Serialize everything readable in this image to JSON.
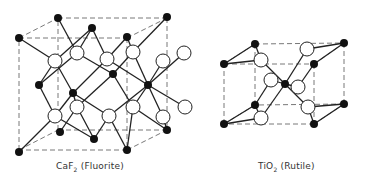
{
  "figures": [
    {
      "id": "fluorite",
      "formula": "CaF",
      "subscript": "2",
      "name": "(Fluorite)",
      "colors": {
        "cation": "#111111",
        "anion": "#ffffff",
        "bond": "#222222",
        "cell": "#555555"
      },
      "cell": {
        "front": [
          [
            19,
            38
          ],
          [
            127,
            38
          ],
          [
            127,
            150
          ],
          [
            19,
            150
          ]
        ],
        "back": [
          [
            58,
            18
          ],
          [
            167,
            18
          ],
          [
            167,
            130
          ],
          [
            58,
            130
          ]
        ]
      },
      "black_atoms": [
        [
          19,
          38
        ],
        [
          58,
          18
        ],
        [
          92,
          28
        ],
        [
          127,
          37
        ],
        [
          167,
          17
        ],
        [
          39,
          85
        ],
        [
          73,
          93
        ],
        [
          113,
          74
        ],
        [
          148,
          85
        ],
        [
          60,
          132
        ],
        [
          94,
          139
        ],
        [
          167,
          130
        ],
        [
          19,
          152
        ],
        [
          127,
          150
        ]
      ],
      "white_atoms": [
        [
          55,
          61
        ],
        [
          77,
          53
        ],
        [
          107,
          59
        ],
        [
          133,
          52
        ],
        [
          163,
          61
        ],
        [
          184,
          53
        ],
        [
          55,
          116
        ],
        [
          77,
          107
        ],
        [
          109,
          116
        ],
        [
          133,
          107
        ],
        [
          163,
          117
        ],
        [
          185,
          107
        ]
      ],
      "bonds": [
        [
          [
            19,
            38
          ],
          [
            55,
            61
          ]
        ],
        [
          [
            92,
            28
          ],
          [
            55,
            61
          ]
        ],
        [
          [
            39,
            85
          ],
          [
            55,
            61
          ]
        ],
        [
          [
            73,
            93
          ],
          [
            55,
            61
          ]
        ],
        [
          [
            92,
            28
          ],
          [
            77,
            53
          ]
        ],
        [
          [
            58,
            18
          ],
          [
            77,
            53
          ]
        ],
        [
          [
            113,
            74
          ],
          [
            77,
            53
          ]
        ],
        [
          [
            39,
            85
          ],
          [
            77,
            53
          ]
        ],
        [
          [
            92,
            28
          ],
          [
            107,
            59
          ]
        ],
        [
          [
            127,
            37
          ],
          [
            107,
            59
          ]
        ],
        [
          [
            73,
            93
          ],
          [
            107,
            59
          ]
        ],
        [
          [
            148,
            85
          ],
          [
            107,
            59
          ]
        ],
        [
          [
            127,
            37
          ],
          [
            133,
            52
          ]
        ],
        [
          [
            167,
            17
          ],
          [
            133,
            52
          ]
        ],
        [
          [
            113,
            74
          ],
          [
            133,
            52
          ]
        ],
        [
          [
            148,
            85
          ],
          [
            133,
            52
          ]
        ],
        [
          [
            148,
            85
          ],
          [
            163,
            61
          ]
        ],
        [
          [
            148,
            85
          ],
          [
            184,
            53
          ]
        ],
        [
          [
            148,
            85
          ],
          [
            163,
            117
          ]
        ],
        [
          [
            148,
            85
          ],
          [
            185,
            107
          ]
        ],
        [
          [
            39,
            85
          ],
          [
            55,
            116
          ]
        ],
        [
          [
            73,
            93
          ],
          [
            55,
            116
          ]
        ],
        [
          [
            19,
            152
          ],
          [
            55,
            116
          ]
        ],
        [
          [
            94,
            139
          ],
          [
            55,
            116
          ]
        ],
        [
          [
            73,
            93
          ],
          [
            77,
            107
          ]
        ],
        [
          [
            113,
            74
          ],
          [
            77,
            107
          ]
        ],
        [
          [
            60,
            132
          ],
          [
            77,
            107
          ]
        ],
        [
          [
            94,
            139
          ],
          [
            77,
            107
          ]
        ],
        [
          [
            73,
            93
          ],
          [
            109,
            116
          ]
        ],
        [
          [
            148,
            85
          ],
          [
            109,
            116
          ]
        ],
        [
          [
            94,
            139
          ],
          [
            109,
            116
          ]
        ],
        [
          [
            127,
            150
          ],
          [
            109,
            116
          ]
        ],
        [
          [
            113,
            74
          ],
          [
            133,
            107
          ]
        ],
        [
          [
            148,
            85
          ],
          [
            133,
            107
          ]
        ],
        [
          [
            167,
            130
          ],
          [
            133,
            107
          ]
        ],
        [
          [
            127,
            150
          ],
          [
            133,
            107
          ]
        ],
        [
          [
            167,
            130
          ],
          [
            163,
            117
          ]
        ]
      ]
    },
    {
      "id": "rutile",
      "formula": "TiO",
      "subscript": "2",
      "name": "(Rutile)",
      "colors": {
        "cation": "#111111",
        "anion": "#ffffff",
        "bond": "#222222",
        "cell": "#555555"
      },
      "cell": {
        "front": [
          [
            224,
            64
          ],
          [
            314,
            64
          ],
          [
            314,
            124
          ],
          [
            224,
            124
          ]
        ],
        "back": [
          [
            255,
            44
          ],
          [
            344,
            43
          ],
          [
            344,
            104
          ],
          [
            255,
            105
          ]
        ]
      },
      "black_atoms": [
        [
          255,
          44
        ],
        [
          344,
          43
        ],
        [
          224,
          64
        ],
        [
          314,
          64
        ],
        [
          285,
          84
        ],
        [
          255,
          105
        ],
        [
          344,
          104
        ],
        [
          224,
          124
        ],
        [
          314,
          124
        ]
      ],
      "white_atoms": [
        [
          261,
          60
        ],
        [
          307,
          49
        ],
        [
          271,
          80
        ],
        [
          298,
          87
        ],
        [
          308,
          107
        ],
        [
          261,
          118
        ]
      ],
      "bonds": [
        [
          [
            224,
            64
          ],
          [
            261,
            60
          ]
        ],
        [
          [
            255,
            44
          ],
          [
            261,
            60
          ]
        ],
        [
          [
            261,
            60
          ],
          [
            285,
            84
          ]
        ],
        [
          [
            344,
            43
          ],
          [
            307,
            49
          ]
        ],
        [
          [
            307,
            49
          ],
          [
            285,
            84
          ]
        ],
        [
          [
            271,
            80
          ],
          [
            285,
            84
          ]
        ],
        [
          [
            298,
            87
          ],
          [
            285,
            84
          ]
        ],
        [
          [
            314,
            64
          ],
          [
            298,
            87
          ]
        ],
        [
          [
            255,
            105
          ],
          [
            271,
            80
          ]
        ],
        [
          [
            285,
            84
          ],
          [
            308,
            107
          ]
        ],
        [
          [
            308,
            107
          ],
          [
            314,
            124
          ]
        ],
        [
          [
            308,
            107
          ],
          [
            344,
            104
          ]
        ],
        [
          [
            224,
            124
          ],
          [
            261,
            118
          ]
        ],
        [
          [
            255,
            105
          ],
          [
            261,
            118
          ]
        ],
        [
          [
            261,
            118
          ],
          [
            285,
            84
          ]
        ],
        [
          [
            224,
            64
          ],
          [
            255,
            44
          ]
        ],
        [
          [
            224,
            124
          ],
          [
            255,
            105
          ]
        ],
        [
          [
            314,
            124
          ],
          [
            344,
            104
          ]
        ],
        [
          [
            314,
            64
          ],
          [
            344,
            43
          ]
        ]
      ]
    }
  ],
  "captions": [
    {
      "formula": "CaF",
      "subscript": "2",
      "name": " (Fluorite)",
      "x": 56,
      "y": 165
    },
    {
      "formula": "TiO",
      "subscript": "2",
      "name": " (Rutile)",
      "x": 258,
      "y": 165
    }
  ]
}
